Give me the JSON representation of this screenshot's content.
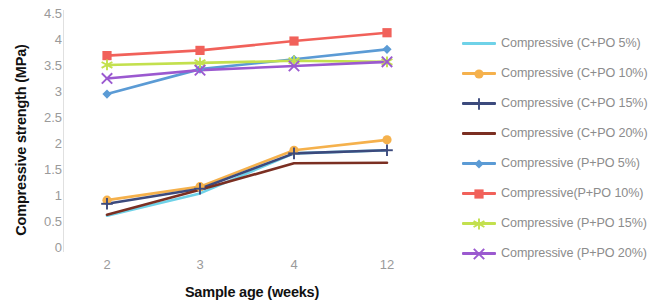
{
  "chart_data": {
    "type": "line",
    "title": "",
    "xlabel": "Sample age (weeks)",
    "ylabel": "Compressive strength (MPa)",
    "categories": [
      "2",
      "3",
      "4",
      "12"
    ],
    "ylim": [
      0,
      4.5
    ],
    "yticks": [
      "0",
      "0.5",
      "1",
      "1.5",
      "2",
      "2.5",
      "3",
      "3.5",
      "4",
      "4.5"
    ],
    "grid": false,
    "legend_position": "right",
    "series": [
      {
        "name": "Compressive (C+PO 5%)",
        "color": "#6fd2e8",
        "marker": "none",
        "values": [
          0.62,
          1.05,
          1.82,
          1.88
        ]
      },
      {
        "name": "Compressive (C+PO 10%)",
        "color": "#f5b14c",
        "marker": "circle",
        "values": [
          0.92,
          1.18,
          1.88,
          2.08
        ]
      },
      {
        "name": "Compressive (C+PO 15%)",
        "color": "#3c4a7d",
        "marker": "plus",
        "values": [
          0.85,
          1.14,
          1.82,
          1.88
        ]
      },
      {
        "name": "Compressive (C+PO 20%)",
        "color": "#7b2f22",
        "marker": "none",
        "values": [
          0.64,
          1.12,
          1.63,
          1.64
        ]
      },
      {
        "name": "Compressive (P+PO 5%)",
        "color": "#5b9bd5",
        "marker": "diamond",
        "values": [
          2.96,
          3.44,
          3.63,
          3.82
        ]
      },
      {
        "name": "Compressive(P+PO 10%)",
        "color": "#f1615a",
        "marker": "square",
        "values": [
          3.7,
          3.8,
          3.98,
          4.14
        ]
      },
      {
        "name": "Compressive (P+PO 15%)",
        "color": "#c3e04e",
        "marker": "star",
        "values": [
          3.52,
          3.56,
          3.6,
          3.58
        ]
      },
      {
        "name": "Compressive (P+PO 20%)",
        "color": "#9b59d0",
        "marker": "cross",
        "values": [
          3.26,
          3.42,
          3.5,
          3.58
        ]
      }
    ]
  }
}
